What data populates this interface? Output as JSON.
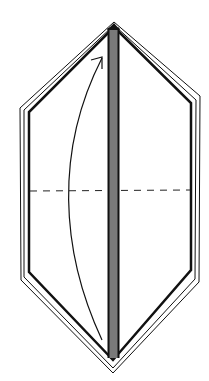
{
  "diagram": {
    "type": "origami-step",
    "colors": {
      "background": "#ffffff",
      "line": "#111111",
      "center_strip": "#7a7a7a"
    },
    "shape": {
      "top_apex": [
        114,
        25
      ],
      "bottom_apex": [
        113,
        366
      ],
      "left_edge_x": 29,
      "right_edge_x": 191,
      "upper_shoulder_y": 108,
      "lower_shoulder_y": 268
    },
    "fold_line": {
      "style": "dashed",
      "y": 191,
      "x_start": 30,
      "x_end": 190
    },
    "arrow": {
      "start": [
        102,
        340
      ],
      "control": [
        52,
        200
      ],
      "end": [
        102,
        57
      ],
      "direction": "up"
    },
    "center_strip": {
      "x": 108,
      "width": 11,
      "y_top": 27,
      "y_bottom": 358
    }
  }
}
